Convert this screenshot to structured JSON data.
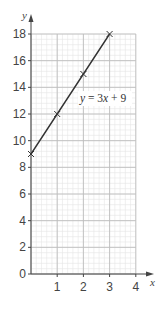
{
  "chart_data": {
    "type": "line",
    "title": "",
    "xlabel": "x",
    "ylabel": "y",
    "xlim": [
      0,
      4
    ],
    "ylim": [
      0,
      18
    ],
    "x_ticks": [
      1,
      2,
      3,
      4
    ],
    "y_ticks": [
      0,
      2,
      4,
      6,
      8,
      10,
      12,
      14,
      16,
      18
    ],
    "grid": true,
    "series": [
      {
        "name": "y = 3x + 9",
        "x": [
          0,
          1,
          2,
          3
        ],
        "values": [
          9,
          12,
          15,
          18
        ],
        "marker": "x"
      }
    ],
    "annotations": [
      {
        "text": "y = 3x + 9",
        "x": 2.2,
        "y": 13
      }
    ]
  },
  "labels": {
    "x_axis": "x",
    "y_axis": "y",
    "equation_y": "y",
    "equation_eq": " = 3",
    "equation_x": "x",
    "equation_rest": " + 9"
  },
  "colors": {
    "line": "#333333",
    "major_grid": "#bdbdbd",
    "minor_grid": "#e6e6e6",
    "axis": "#444444"
  }
}
